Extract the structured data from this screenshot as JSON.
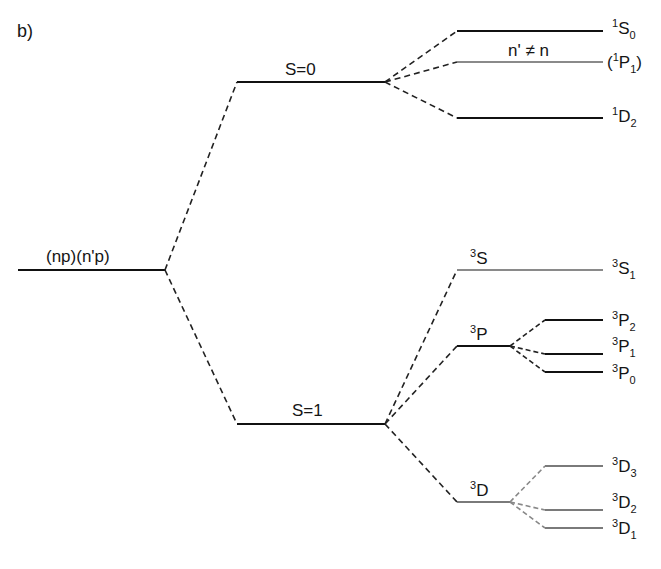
{
  "panel_label": "b)",
  "colors": {
    "solid_level": "#111111",
    "gray_level": "#7a7a7a",
    "dashed": "#222222",
    "dashed_gray": "#888888"
  },
  "levels": {
    "config": {
      "label": "(np)(n'p)",
      "x1": 18,
      "x2": 165,
      "y": 270,
      "color": "#111111"
    },
    "singlet": {
      "label": "S=0",
      "x1": 237,
      "x2": 385,
      "y": 82,
      "color": "#111111"
    },
    "triplet": {
      "label": "S=1",
      "x1": 237,
      "x2": 385,
      "y": 424,
      "color": "#111111"
    },
    "t3S": {
      "label_sup": "3",
      "label_main": "S",
      "x1": 457,
      "x2": 603,
      "y": 270,
      "color": "#8a8a8a"
    },
    "t3P": {
      "label_sup": "3",
      "label_main": "P",
      "x1": 457,
      "x2": 510,
      "y": 346,
      "color": "#111111"
    },
    "t3D": {
      "label_sup": "3",
      "label_main": "D",
      "x1": 457,
      "x2": 510,
      "y": 502,
      "color": "#7a7a7a"
    }
  },
  "fine_levels": [
    {
      "id": "1S0",
      "sup": "1",
      "main": "S",
      "sub": "0",
      "prefix": "",
      "suffix": "",
      "x1": 457,
      "x2": 603,
      "y": 31,
      "color": "#111111"
    },
    {
      "id": "1P1",
      "sup": "1",
      "main": "P",
      "sub": "1",
      "prefix": "(",
      "suffix": ")",
      "x1": 457,
      "x2": 603,
      "y": 62,
      "color": "#8a8a8a"
    },
    {
      "id": "1D2",
      "sup": "1",
      "main": "D",
      "sub": "2",
      "prefix": "",
      "suffix": "",
      "x1": 457,
      "x2": 603,
      "y": 118,
      "color": "#111111"
    },
    {
      "id": "3S1",
      "sup": "3",
      "main": "S",
      "sub": "1",
      "prefix": "",
      "suffix": "",
      "x1": 457,
      "x2": 603,
      "y": 270,
      "color": "#8a8a8a"
    },
    {
      "id": "3P2",
      "sup": "3",
      "main": "P",
      "sub": "2",
      "prefix": "",
      "suffix": "",
      "x1": 545,
      "x2": 603,
      "y": 320,
      "color": "#111111"
    },
    {
      "id": "3P1",
      "sup": "3",
      "main": "P",
      "sub": "1",
      "prefix": "",
      "suffix": "",
      "x1": 545,
      "x2": 603,
      "y": 354,
      "color": "#111111"
    },
    {
      "id": "3P0",
      "sup": "3",
      "main": "P",
      "sub": "0",
      "prefix": "",
      "suffix": "",
      "x1": 545,
      "x2": 603,
      "y": 372,
      "color": "#111111"
    },
    {
      "id": "3D3",
      "sup": "3",
      "main": "D",
      "sub": "3",
      "prefix": "",
      "suffix": "",
      "x1": 545,
      "x2": 603,
      "y": 466,
      "color": "#7a7a7a"
    },
    {
      "id": "3D2",
      "sup": "3",
      "main": "D",
      "sub": "2",
      "prefix": "",
      "suffix": "",
      "x1": 545,
      "x2": 603,
      "y": 510,
      "color": "#7a7a7a"
    },
    {
      "id": "3D1",
      "sup": "3",
      "main": "D",
      "sub": "1",
      "prefix": "",
      "suffix": "",
      "x1": 545,
      "x2": 603,
      "y": 528,
      "color": "#7a7a7a"
    }
  ],
  "annotation": {
    "text": "n' ≠ n"
  },
  "labels": {
    "s0": "S=0",
    "s1": "S=1",
    "config": "(np)(n'p)",
    "sup1": "1",
    "sup3": "3",
    "S": "S",
    "P": "P",
    "D": "D",
    "sub0": "0",
    "sub1": "1",
    "sub2": "2",
    "sub3": "3",
    "lparen": "(",
    "rparen": ")"
  }
}
